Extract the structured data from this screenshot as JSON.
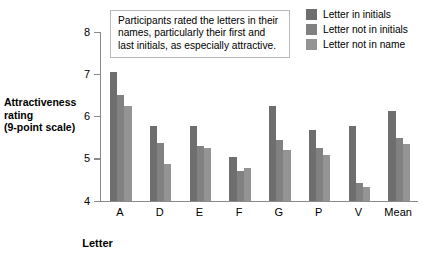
{
  "chart_data": {
    "type": "bar",
    "title": "",
    "xlabel": "Letter",
    "ylabel": "Attractiveness rating (9-point scale)",
    "ylim": [
      4,
      8
    ],
    "yticks": [
      4,
      5,
      6,
      7,
      8
    ],
    "grid": false,
    "legend_position": "top-right",
    "categories": [
      "A",
      "D",
      "E",
      "F",
      "G",
      "P",
      "V",
      "Mean"
    ],
    "series": [
      {
        "name": "Letter in initials",
        "color": "#6e6e6e",
        "values": [
          7.05,
          5.78,
          5.78,
          5.05,
          6.25,
          5.67,
          5.78,
          6.12
        ]
      },
      {
        "name": "Letter not in initials",
        "color": "#818181",
        "values": [
          6.5,
          5.37,
          5.3,
          4.72,
          5.45,
          5.25,
          4.42,
          5.5
        ]
      },
      {
        "name": "Letter not in name",
        "color": "#949494",
        "values": [
          6.25,
          4.88,
          5.25,
          4.78,
          5.2,
          5.1,
          4.33,
          5.35
        ]
      }
    ],
    "annotation": "Participants rated the letters in their names, particularly their first and last initials, as especially attractive."
  },
  "axes": {
    "y_title_line1": "Attractiveness",
    "y_title_line2": "rating",
    "y_title_line3": "(9-point scale)",
    "x_title": "Letter",
    "y_tick_labels": [
      "8",
      "7",
      "6",
      "5",
      "4"
    ],
    "x_tick_labels": [
      "A",
      "D",
      "E",
      "F",
      "G",
      "P",
      "V",
      "Mean"
    ]
  },
  "legend": {
    "items": [
      {
        "label": "Letter in initials",
        "color": "#6e6e6e"
      },
      {
        "label": "Letter not in initials",
        "color": "#818181"
      },
      {
        "label": "Letter not in name",
        "color": "#949494"
      }
    ]
  },
  "annotation": {
    "text": "Participants rated the letters in their names, particularly their first and last initials, as especially attractive."
  }
}
